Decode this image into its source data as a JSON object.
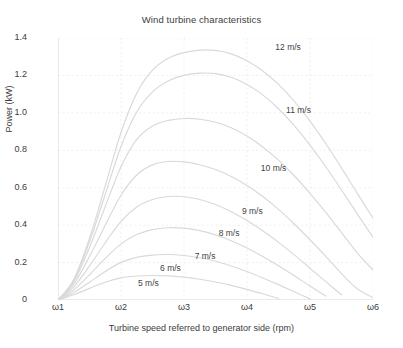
{
  "chart_data": {
    "type": "line",
    "title": "Wind turbine characteristics",
    "xlabel": "Turbine speed referred to generator side (rpm)",
    "ylabel": "Power (kW)",
    "grid": true,
    "legend_position": "inline-annotations",
    "xlim": [
      0,
      5
    ],
    "ylim": [
      0,
      1.4
    ],
    "xtick_labels": [
      "ω1",
      "ω2",
      "ω3",
      "ω4",
      "ω5",
      "ω6"
    ],
    "xtick_values": [
      0,
      1,
      2,
      3,
      4,
      5
    ],
    "ytick_labels": [
      "0",
      "0.2",
      "0.4",
      "0.6",
      "0.8",
      "1.0",
      "1.2",
      "1.4"
    ],
    "ytick_values": [
      0,
      0.2,
      0.4,
      0.6,
      0.8,
      1.0,
      1.2,
      1.4
    ],
    "x": [
      0,
      0.25,
      0.5,
      0.75,
      1.0,
      1.25,
      1.5,
      1.75,
      2.0,
      2.25,
      2.5,
      2.75,
      3.0,
      3.25,
      3.5,
      3.75,
      4.0,
      4.25,
      4.5,
      4.75,
      5.0
    ],
    "series": [
      {
        "name": "5 m/s",
        "label": "5 m/s",
        "values": [
          0,
          0.028,
          0.062,
          0.095,
          0.118,
          0.128,
          0.131,
          0.129,
          0.122,
          0.111,
          0.096,
          0.078,
          0.057,
          0.033,
          0.008,
          null,
          null,
          null,
          null,
          null,
          null
        ]
      },
      {
        "name": "6 m/s",
        "label": "6 m/s",
        "values": [
          0,
          0.04,
          0.095,
          0.152,
          0.201,
          0.228,
          0.24,
          0.243,
          0.238,
          0.226,
          0.207,
          0.182,
          0.152,
          0.118,
          0.082,
          0.044,
          0.006,
          null,
          null,
          null,
          null
        ]
      },
      {
        "name": "7 m/s",
        "label": "7 m/s",
        "values": [
          0,
          0.055,
          0.135,
          0.222,
          0.3,
          0.35,
          0.376,
          0.386,
          0.384,
          0.371,
          0.348,
          0.317,
          0.278,
          0.233,
          0.183,
          0.13,
          0.075,
          0.021,
          null,
          null,
          null
        ]
      },
      {
        "name": "8 m/s",
        "label": "8 m/s",
        "values": [
          0,
          0.07,
          0.182,
          0.306,
          0.42,
          0.497,
          0.537,
          0.553,
          0.552,
          0.537,
          0.51,
          0.472,
          0.425,
          0.37,
          0.308,
          0.241,
          0.17,
          0.098,
          0.028,
          null,
          null
        ]
      },
      {
        "name": "9 m/s",
        "label": "9 m/s",
        "values": [
          0,
          0.085,
          0.232,
          0.4,
          0.56,
          0.668,
          0.722,
          0.74,
          0.738,
          0.723,
          0.697,
          0.66,
          0.612,
          0.553,
          0.484,
          0.406,
          0.322,
          0.233,
          0.141,
          0.06,
          0.012
        ]
      },
      {
        "name": "10 m/s",
        "label": "10 m/s",
        "values": [
          0,
          0.098,
          0.28,
          0.5,
          0.712,
          0.858,
          0.93,
          0.96,
          0.97,
          0.966,
          0.95,
          0.92,
          0.876,
          0.818,
          0.747,
          0.664,
          0.57,
          0.468,
          0.36,
          0.252,
          0.16
        ]
      },
      {
        "name": "11 m/s",
        "label": "11 m/s",
        "values": [
          0,
          0.105,
          0.31,
          0.565,
          0.82,
          1.005,
          1.112,
          1.17,
          1.2,
          1.212,
          1.21,
          1.19,
          1.152,
          1.096,
          1.022,
          0.932,
          0.828,
          0.712,
          0.588,
          0.46,
          0.336
        ]
      },
      {
        "name": "12 m/s",
        "label": "12 m/s",
        "values": [
          0,
          0.11,
          0.33,
          0.61,
          0.895,
          1.105,
          1.228,
          1.292,
          1.322,
          1.335,
          1.334,
          1.315,
          1.278,
          1.224,
          1.152,
          1.062,
          0.956,
          0.836,
          0.706,
          0.57,
          0.438
        ]
      }
    ],
    "annotations": [
      {
        "text": "12 m/s",
        "x": 3.45,
        "y": 1.345
      },
      {
        "text": "11 m/s",
        "x": 3.62,
        "y": 1.012
      },
      {
        "text": "10 m/s",
        "x": 3.22,
        "y": 0.7
      },
      {
        "text": "9 m/s",
        "x": 2.92,
        "y": 0.472
      },
      {
        "text": "8 m/s",
        "x": 2.55,
        "y": 0.352
      },
      {
        "text": "7 m/s",
        "x": 2.17,
        "y": 0.232
      },
      {
        "text": "6 m/s",
        "x": 1.62,
        "y": 0.165
      },
      {
        "text": "5 m/s",
        "x": 1.27,
        "y": 0.083
      }
    ],
    "colors": {
      "curve": "#d9d9d9",
      "grid": "#e8e8e8",
      "axis": "#cfcfcf",
      "text": "#3c3c3c"
    }
  }
}
